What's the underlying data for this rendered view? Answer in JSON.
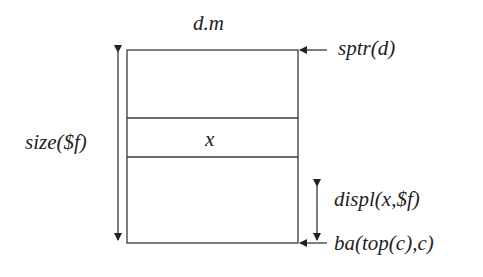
{
  "diagram": {
    "title": "d.m",
    "cell_label": "x",
    "labels": {
      "stack_pointer": "sptr(d)",
      "frame_size": "size($f)",
      "displacement": "displ(x,$f)",
      "base_address": "ba(top(c),c)"
    },
    "colors": {
      "line": "#3a3a3a",
      "text": "#222222",
      "background": "#ffffff"
    }
  }
}
